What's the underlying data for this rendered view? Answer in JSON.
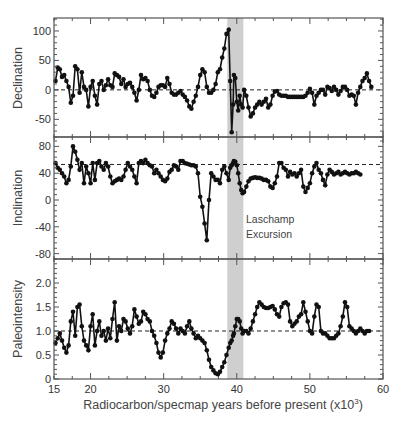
{
  "chart_data": [
    {
      "type": "line",
      "panel": "top",
      "ylabel": "Declination",
      "ylim": [
        -80,
        122
      ],
      "yticks": [
        -50,
        0,
        50,
        100
      ],
      "yticklabels": [
        "-50",
        "0",
        "50",
        "100"
      ],
      "reference_line": 0,
      "xlim": [
        15,
        60
      ],
      "marker": "filled-circle",
      "x": [
        15.2,
        15.5,
        15.8,
        16.1,
        16.4,
        16.7,
        17.0,
        17.3,
        17.6,
        17.9,
        18.2,
        18.5,
        18.8,
        19.1,
        19.4,
        19.7,
        20.0,
        20.3,
        20.6,
        20.9,
        21.2,
        21.5,
        21.8,
        22.1,
        22.4,
        22.7,
        23.0,
        23.3,
        23.6,
        23.9,
        24.2,
        24.5,
        24.8,
        25.1,
        25.4,
        25.7,
        26.0,
        26.3,
        26.6,
        26.9,
        27.2,
        27.5,
        27.8,
        28.1,
        28.4,
        28.7,
        29.0,
        29.3,
        29.6,
        29.9,
        30.2,
        30.5,
        30.8,
        31.1,
        31.4,
        31.7,
        32.0,
        32.3,
        32.6,
        32.9,
        33.2,
        33.5,
        33.8,
        34.1,
        34.4,
        34.7,
        35.0,
        35.3,
        35.6,
        35.9,
        36.2,
        36.5,
        36.8,
        37.1,
        37.4,
        37.7,
        38.0,
        38.3,
        38.6,
        38.9,
        39.1,
        39.3,
        39.5,
        39.6,
        39.8,
        40.0,
        40.2,
        40.4,
        40.6,
        40.8,
        41.0,
        41.3,
        41.6,
        41.9,
        42.2,
        42.5,
        42.8,
        43.1,
        43.4,
        43.7,
        44.0,
        44.3,
        44.6,
        44.9,
        45.2,
        45.5,
        45.8,
        46.1,
        46.4,
        46.7,
        47.0,
        47.3,
        47.6,
        47.9,
        48.2,
        48.5,
        48.8,
        49.1,
        49.4,
        49.7,
        50.0,
        50.3,
        50.6,
        50.9,
        51.2,
        51.5,
        51.8,
        52.1,
        52.4,
        52.7,
        53.0,
        53.3,
        53.6,
        53.9,
        54.2,
        54.5,
        54.8,
        55.1,
        55.4,
        55.7,
        56.0,
        56.3,
        56.6,
        56.9,
        57.2,
        57.5,
        57.8,
        58.1,
        58.4,
        58.7,
        59.0,
        59.3
      ],
      "values": [
        15,
        38,
        35,
        22,
        25,
        15,
        5,
        -22,
        -10,
        40,
        35,
        -5,
        30,
        5,
        0,
        -28,
        5,
        15,
        -10,
        -25,
        10,
        15,
        0,
        8,
        18,
        8,
        5,
        28,
        25,
        22,
        10,
        18,
        5,
        10,
        12,
        5,
        -5,
        -18,
        0,
        25,
        18,
        20,
        15,
        0,
        -10,
        -12,
        -5,
        5,
        8,
        8,
        5,
        20,
        10,
        -5,
        -8,
        -8,
        -5,
        -2,
        -8,
        -12,
        -18,
        -28,
        -32,
        -20,
        -10,
        5,
        25,
        35,
        30,
        5,
        -5,
        -5,
        0,
        10,
        30,
        35,
        55,
        70,
        95,
        102,
        15,
        -72,
        -25,
        25,
        20,
        -20,
        -35,
        -10,
        -25,
        -30,
        0,
        -10,
        -30,
        -45,
        -40,
        -30,
        -25,
        -20,
        -25,
        -20,
        -15,
        -30,
        -25,
        -10,
        -3,
        -2,
        -8,
        -10,
        -10,
        -10,
        -12,
        -12,
        -12,
        -12,
        -12,
        -12,
        -12,
        -12,
        -10,
        -5,
        2,
        -5,
        -25,
        -10,
        -5,
        0,
        0,
        -8,
        5,
        3,
        -2,
        5,
        0,
        -8,
        -2,
        5,
        5,
        0,
        -10,
        -8,
        -10,
        -25,
        -5,
        5,
        15,
        20,
        28,
        15,
        5
      ]
    },
    {
      "type": "line",
      "panel": "middle",
      "ylabel": "Inclination",
      "ylim": [
        -88,
        94
      ],
      "yticks": [
        -80,
        -40,
        0,
        40,
        80
      ],
      "yticklabels": [
        "-80",
        "-40",
        "0",
        "40",
        "80"
      ],
      "reference_line": 53,
      "xlim": [
        15,
        60
      ],
      "annotation": {
        "text": [
          "Laschamp",
          "Excursion"
        ],
        "x": 40.9,
        "y": -38
      },
      "x": [
        15.2,
        15.5,
        15.8,
        16.1,
        16.4,
        16.7,
        17.0,
        17.3,
        17.6,
        17.9,
        18.2,
        18.5,
        18.8,
        19.1,
        19.4,
        19.7,
        20.0,
        20.3,
        20.6,
        20.9,
        21.2,
        21.5,
        21.8,
        22.1,
        22.4,
        22.7,
        23.0,
        23.3,
        23.6,
        23.9,
        24.2,
        24.5,
        24.8,
        25.1,
        25.4,
        25.7,
        26.0,
        26.3,
        26.6,
        26.9,
        27.2,
        27.5,
        27.8,
        28.1,
        28.4,
        28.7,
        29.0,
        29.3,
        29.6,
        29.9,
        30.2,
        30.5,
        30.8,
        31.1,
        31.4,
        31.7,
        32.0,
        32.3,
        32.6,
        32.9,
        33.2,
        33.5,
        33.8,
        34.1,
        34.4,
        34.7,
        35.0,
        35.3,
        35.6,
        35.9,
        36.2,
        36.5,
        36.8,
        37.1,
        37.4,
        37.7,
        38.0,
        38.3,
        38.6,
        38.9,
        39.1,
        39.3,
        39.5,
        39.6,
        39.8,
        40.0,
        40.2,
        40.4,
        40.6,
        40.8,
        41.0,
        41.3,
        41.6,
        41.9,
        42.2,
        42.5,
        42.8,
        43.1,
        43.4,
        43.7,
        44.0,
        44.3,
        44.6,
        44.9,
        45.2,
        45.5,
        45.8,
        46.1,
        46.4,
        46.7,
        47.0,
        47.3,
        47.6,
        47.9,
        48.2,
        48.5,
        48.8,
        49.1,
        49.4,
        49.7,
        50.0,
        50.3,
        50.6,
        50.9,
        51.2,
        51.5,
        51.8,
        52.1,
        52.4,
        52.7,
        53.0,
        53.3,
        53.6,
        53.9,
        54.2,
        54.5,
        54.8,
        55.1,
        55.4,
        55.7,
        56.0,
        56.3,
        56.6,
        56.9,
        57.2,
        57.5,
        57.8,
        58.1,
        58.4,
        58.7,
        59.0,
        59.3
      ],
      "values": [
        55,
        48,
        45,
        40,
        35,
        25,
        30,
        50,
        80,
        72,
        60,
        45,
        55,
        25,
        50,
        40,
        25,
        55,
        30,
        55,
        58,
        50,
        45,
        55,
        50,
        35,
        25,
        28,
        30,
        32,
        30,
        35,
        45,
        55,
        50,
        45,
        35,
        25,
        55,
        58,
        55,
        60,
        55,
        52,
        50,
        40,
        45,
        40,
        35,
        30,
        28,
        32,
        42,
        45,
        52,
        50,
        45,
        58,
        58,
        55,
        54,
        53,
        52,
        52,
        50,
        40,
        5,
        -10,
        -35,
        -60,
        0,
        40,
        35,
        30,
        30,
        25,
        45,
        50,
        40,
        30,
        48,
        52,
        55,
        58,
        57,
        52,
        40,
        25,
        15,
        10,
        12,
        20,
        28,
        32,
        33,
        34,
        33,
        33,
        32,
        30,
        30,
        28,
        20,
        18,
        25,
        35,
        55,
        55,
        48,
        45,
        35,
        42,
        38,
        40,
        35,
        40,
        45,
        20,
        12,
        18,
        25,
        40,
        50,
        55,
        45,
        40,
        30,
        22,
        38,
        45,
        42,
        38,
        40,
        42,
        38,
        40,
        42,
        40,
        38,
        40,
        40,
        42,
        40,
        38
      ],
      "x_note": "values aligned to first 148 x positions"
    },
    {
      "type": "line",
      "panel": "bottom",
      "ylabel": "Paleointensity",
      "xlabel": "Radiocarbon/specmap years before present (x10^3)",
      "ylim": [
        0,
        2.5
      ],
      "yticks": [
        0,
        0.5,
        1.0,
        1.5,
        2.0
      ],
      "yticklabels": [
        "0",
        "0.5",
        "1.0",
        "1.5",
        "2.0"
      ],
      "reference_line": 1.0,
      "xlim": [
        15,
        60
      ],
      "xticks": [
        15,
        20,
        30,
        40,
        50,
        60
      ],
      "xticklabels": [
        "15",
        "20",
        "30",
        "40",
        "50",
        "60"
      ],
      "shaded_band": {
        "x0": 38.7,
        "x1": 40.9,
        "label": "Laschamp Excursion"
      },
      "x": [
        15.2,
        15.5,
        15.8,
        16.1,
        16.4,
        16.7,
        17.0,
        17.3,
        17.6,
        17.9,
        18.2,
        18.5,
        18.8,
        19.1,
        19.4,
        19.7,
        20.0,
        20.3,
        20.6,
        20.9,
        21.2,
        21.5,
        21.8,
        22.1,
        22.4,
        22.7,
        23.0,
        23.3,
        23.6,
        23.9,
        24.2,
        24.5,
        24.8,
        25.1,
        25.4,
        25.7,
        26.0,
        26.3,
        26.6,
        26.9,
        27.2,
        27.5,
        27.8,
        28.1,
        28.4,
        28.7,
        29.0,
        29.3,
        29.6,
        29.9,
        30.2,
        30.5,
        30.8,
        31.1,
        31.4,
        31.7,
        32.0,
        32.3,
        32.6,
        32.9,
        33.2,
        33.5,
        33.8,
        34.1,
        34.4,
        34.7,
        35.0,
        35.3,
        35.6,
        35.9,
        36.2,
        36.5,
        36.8,
        37.1,
        37.4,
        37.7,
        38.0,
        38.3,
        38.6,
        38.9,
        39.1,
        39.3,
        39.5,
        39.6,
        39.8,
        40.0,
        40.2,
        40.4,
        40.6,
        40.8,
        41.0,
        41.3,
        41.6,
        41.9,
        42.2,
        42.5,
        42.8,
        43.1,
        43.4,
        43.7,
        44.0,
        44.3,
        44.6,
        44.9,
        45.2,
        45.5,
        45.8,
        46.1,
        46.4,
        46.7,
        47.0,
        47.3,
        47.6,
        47.9,
        48.2,
        48.5,
        48.8,
        49.1,
        49.4,
        49.7,
        50.0,
        50.3,
        50.6,
        50.9,
        51.2,
        51.5,
        51.8,
        52.1,
        52.4,
        52.7,
        53.0,
        53.3,
        53.6,
        53.9,
        54.2,
        54.5,
        54.8,
        55.1,
        55.4,
        55.7,
        56.0,
        56.3,
        56.6,
        56.9,
        57.2,
        57.5,
        57.8,
        58.1,
        58.4,
        58.7,
        59.0,
        59.3
      ],
      "values": [
        0.75,
        0.85,
        0.95,
        0.8,
        0.65,
        0.55,
        0.7,
        1.2,
        1.4,
        0.9,
        1.5,
        1.55,
        1.1,
        0.8,
        0.7,
        0.6,
        1.1,
        1.35,
        0.7,
        1.0,
        1.2,
        0.9,
        1.0,
        0.8,
        1.05,
        0.85,
        1.25,
        1.6,
        0.8,
        1.1,
        1.0,
        1.25,
        1.2,
        1.05,
        0.95,
        1.1,
        1.45,
        1.3,
        1.15,
        1.2,
        1.4,
        1.35,
        1.25,
        1.2,
        1.0,
        0.9,
        0.75,
        0.55,
        0.45,
        0.55,
        0.8,
        0.95,
        1.05,
        1.2,
        1.15,
        1.05,
        0.95,
        1.05,
        1.0,
        0.95,
        1.1,
        1.2,
        1.05,
        0.95,
        0.85,
        0.9,
        0.85,
        0.8,
        0.75,
        0.6,
        0.4,
        0.25,
        0.18,
        0.12,
        0.1,
        0.15,
        0.25,
        0.35,
        0.5,
        0.65,
        0.75,
        0.8,
        0.9,
        0.95,
        1.1,
        1.25,
        1.25,
        1.2,
        1.05,
        0.95,
        1.0,
        1.0,
        0.95,
        1.05,
        1.2,
        1.35,
        1.5,
        1.6,
        1.55,
        1.5,
        1.48,
        1.48,
        1.5,
        1.52,
        1.45,
        1.35,
        1.3,
        1.5,
        1.58,
        1.6,
        1.55,
        1.2,
        1.1,
        1.15,
        1.2,
        1.3,
        1.35,
        1.6,
        1.4,
        1.2,
        1.0,
        0.95,
        1.3,
        1.55,
        1.5,
        1.0,
        0.95,
        0.95,
        0.9,
        0.85,
        0.85,
        0.85,
        0.9,
        0.95,
        1.1,
        1.3,
        1.6,
        1.5,
        1.1,
        1.05,
        1.0,
        0.95,
        1.0,
        1.05,
        1.0,
        0.95,
        1.0,
        1.0
      ]
    }
  ],
  "labels": {
    "xlabel_main": "Radiocarbon/specmap years before present (x10",
    "xlabel_sup": "3",
    "xlabel_end": ")",
    "annotation_line1": "Laschamp",
    "annotation_line2": "Excursion",
    "ylabel_top": "Declination",
    "ylabel_middle": "Inclination",
    "ylabel_bottom": "Paleointensity"
  },
  "colors": {
    "line": "#111111",
    "frame": "#555555",
    "band": "#cfcfcf",
    "text": "#333333"
  }
}
